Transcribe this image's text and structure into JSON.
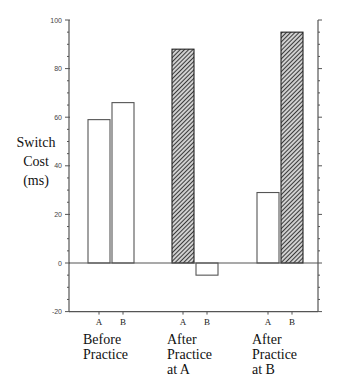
{
  "chart_data": {
    "type": "bar",
    "title": "",
    "xlabel": "",
    "ylabel": [
      "Switch",
      "Cost",
      "(ms)"
    ],
    "ylim": [
      -20,
      100
    ],
    "yticks_major": [
      -20,
      0,
      20,
      40,
      60,
      80,
      100
    ],
    "ytick_minor_step": 5,
    "grid": false,
    "legend": null,
    "groups": [
      {
        "label": [
          "Before",
          "Practice"
        ],
        "bars": [
          {
            "label": "A",
            "value": 59,
            "fill": "white"
          },
          {
            "label": "B",
            "value": 66,
            "fill": "white"
          }
        ]
      },
      {
        "label": [
          "After",
          "Practice",
          "at A"
        ],
        "bars": [
          {
            "label": "A",
            "value": 88,
            "fill": "hatched"
          },
          {
            "label": "B",
            "value": -5,
            "fill": "white"
          }
        ]
      },
      {
        "label": [
          "After",
          "Practice",
          "at B"
        ],
        "bars": [
          {
            "label": "A",
            "value": 29,
            "fill": "white"
          },
          {
            "label": "B",
            "value": 95,
            "fill": "hatched"
          }
        ]
      }
    ],
    "colors": {
      "outline": "#555555",
      "hatch": "#333333",
      "background": "#ffffff"
    }
  }
}
